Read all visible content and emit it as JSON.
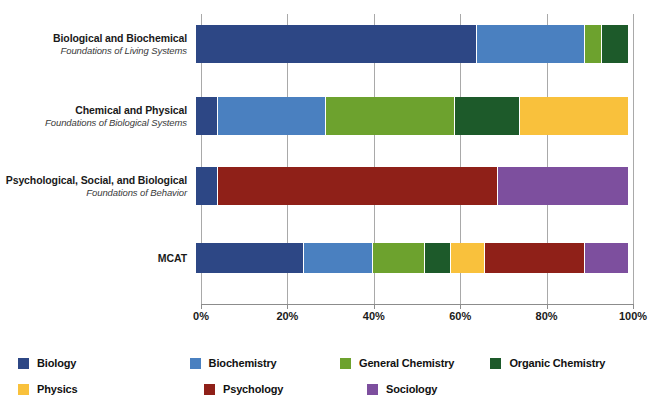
{
  "chart_data": {
    "type": "bar",
    "orientation": "horizontal",
    "stacked": true,
    "title": "",
    "xlabel": "",
    "ylabel": "",
    "xlim": [
      0,
      100
    ],
    "xticks": [
      "0%",
      "20%",
      "40%",
      "60%",
      "80%",
      "100%"
    ],
    "xtick_values": [
      0,
      20,
      40,
      60,
      80,
      100
    ],
    "grid": true,
    "grid_axis": "x",
    "legend_position": "bottom",
    "categories": [
      {
        "label": "Biological and Biochemical",
        "sublabel": "Foundations of Living Systems"
      },
      {
        "label": "Chemical and Physical",
        "sublabel": "Foundations of Biological Systems"
      },
      {
        "label": "Psychological, Social, and Biological",
        "sublabel": "Foundations of Behavior"
      },
      {
        "label": "MCAT",
        "sublabel": ""
      }
    ],
    "series": [
      {
        "name": "Biology",
        "color": "#2d4785",
        "values": [
          65,
          5,
          5,
          25
        ]
      },
      {
        "name": "Biochemistry",
        "color": "#4a80c0",
        "values": [
          25,
          25,
          0,
          16
        ]
      },
      {
        "name": "General Chemistry",
        "color": "#6da22e",
        "values": [
          4,
          30,
          0,
          12
        ]
      },
      {
        "name": "Organic Chemistry",
        "color": "#1d5a2a",
        "values": [
          6,
          15,
          0,
          6
        ]
      },
      {
        "name": "Physics",
        "color": "#f9c13c",
        "values": [
          0,
          25,
          0,
          8
        ]
      },
      {
        "name": "Psychology",
        "color": "#8f2018",
        "values": [
          0,
          0,
          65,
          23
        ]
      },
      {
        "name": "Sociology",
        "color": "#7d4f9e",
        "values": [
          0,
          0,
          30,
          10
        ]
      }
    ]
  },
  "legend": {
    "rows": [
      [
        {
          "label": "Biology",
          "color": "#2d4785"
        },
        {
          "label": "Biochemistry",
          "color": "#4a80c0"
        },
        {
          "label": "General Chemistry",
          "color": "#6da22e"
        },
        {
          "label": "Organic Chemistry",
          "color": "#1d5a2a"
        }
      ],
      [
        {
          "label": "Physics",
          "color": "#f9c13c"
        },
        {
          "label": "Psychology",
          "color": "#8f2018"
        },
        {
          "label": "Sociology",
          "color": "#7d4f9e"
        }
      ]
    ]
  }
}
